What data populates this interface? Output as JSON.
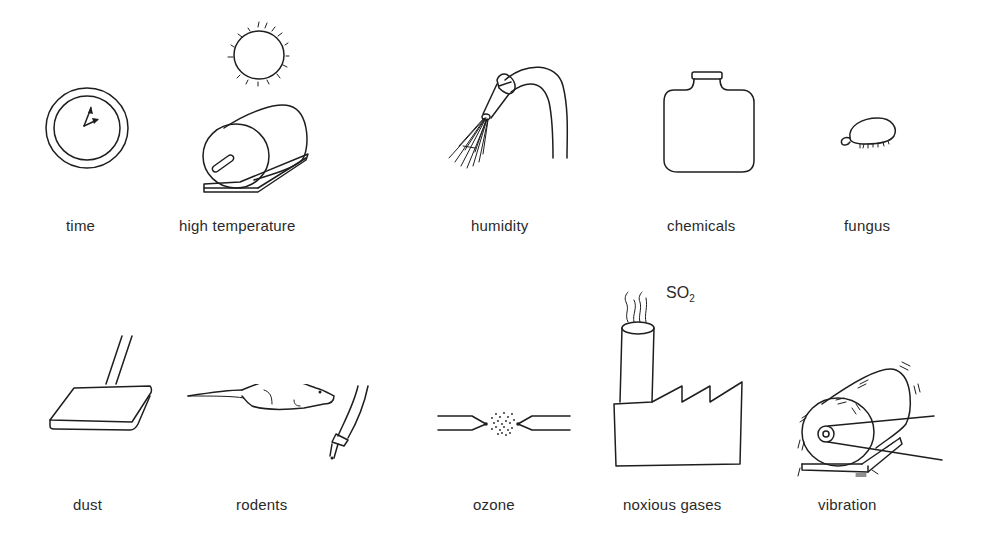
{
  "figure": {
    "items": [
      {
        "id": "time",
        "label": "time",
        "icon": "clock-icon"
      },
      {
        "id": "high-temperature",
        "label": "high temperature",
        "icon": "sun-over-motor-icon"
      },
      {
        "id": "humidity",
        "label": "humidity",
        "icon": "water-hose-spray-icon"
      },
      {
        "id": "chemicals",
        "label": "chemicals",
        "icon": "chemical-bottle-icon"
      },
      {
        "id": "fungus",
        "label": "fungus",
        "icon": "fungus-spore-icon"
      },
      {
        "id": "dust",
        "label": "dust",
        "icon": "dust-mop-icon"
      },
      {
        "id": "rodents",
        "label": "rodents",
        "icon": "rodent-chewing-cable-icon"
      },
      {
        "id": "ozone",
        "label": "ozone",
        "icon": "corona-discharge-icon"
      },
      {
        "id": "noxious-gases",
        "label": "noxious gases",
        "icon": "factory-smokestack-icon"
      },
      {
        "id": "vibration",
        "label": "vibration",
        "icon": "vibrating-motor-icon"
      }
    ],
    "annotations": {
      "so2_main": "SO",
      "so2_sub": "2"
    }
  }
}
